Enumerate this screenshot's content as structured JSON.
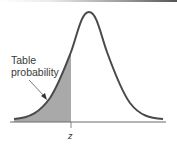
{
  "figure": {
    "type": "normal-distribution-curve",
    "annotation": {
      "line1": "Table",
      "line2": "probability"
    },
    "axis_label": "z",
    "colors": {
      "curve": "#4a4a4a",
      "shade": "#a9a9a9",
      "axis": "#6a6a6a",
      "text": "#3a3a3a"
    }
  }
}
